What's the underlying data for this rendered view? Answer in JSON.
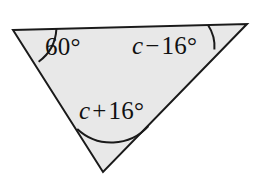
{
  "figure": {
    "kind": "triangle-angle-diagram",
    "fill_color": "#e8e8e8",
    "stroke_color": "#1a1a1a",
    "arc_color": "#1a1a1a",
    "background_color": "#ffffff",
    "stroke_width": 2,
    "arc_width": 2,
    "vertices": {
      "left": {
        "x": 13,
        "y": 30
      },
      "top_right": {
        "x": 247,
        "y": 24
      },
      "bottom": {
        "x": 103,
        "y": 172
      }
    },
    "labels": {
      "left_angle": {
        "text": "60°",
        "value": "60",
        "degree": "°"
      },
      "right_angle": {
        "variable": "c",
        "operator": "−",
        "value": "16",
        "degree": "°",
        "text": "c − 16°"
      },
      "bottom_angle": {
        "variable": "c",
        "operator": "+",
        "value": "16",
        "degree": "°",
        "text": "c + 16°"
      }
    },
    "arcs": {
      "left_arc": "angle arc at left vertex",
      "right_arc": "angle arc at top-right vertex",
      "bottom_arc": "angle arc at bottom vertex"
    }
  }
}
